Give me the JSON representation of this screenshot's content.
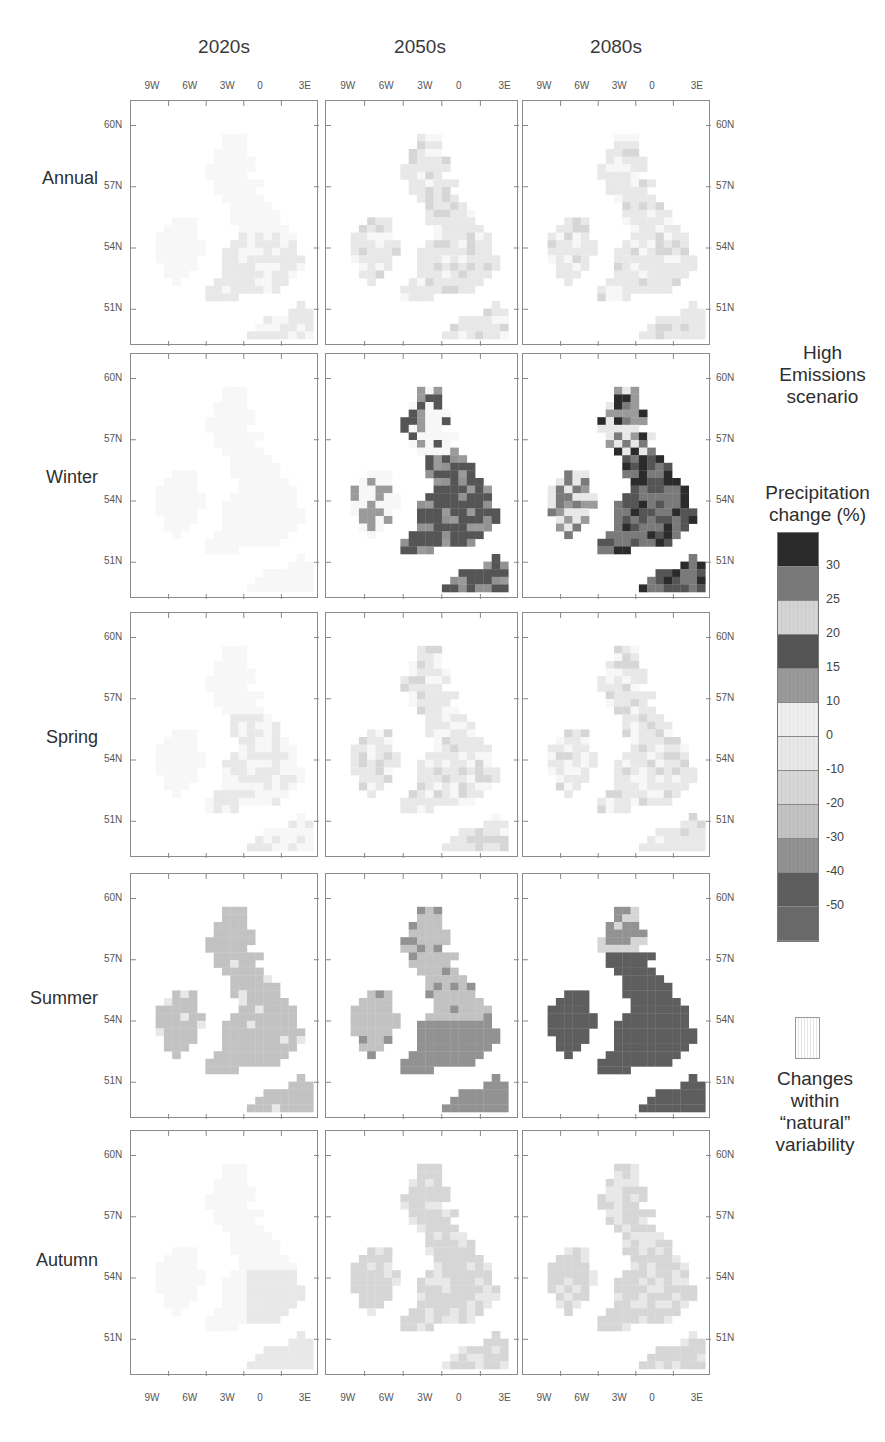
{
  "chart_data": {
    "type": "heatmap",
    "title": "High Emissions scenario",
    "subtitle": "Precipitation change (%)",
    "columns": [
      "2020s",
      "2050s",
      "2080s"
    ],
    "rows": [
      "Annual",
      "Winter",
      "Spring",
      "Summer",
      "Autumn"
    ],
    "x_ticks": [
      "9W",
      "6W",
      "3W",
      "0",
      "3E"
    ],
    "y_ticks": [
      "60N",
      "57N",
      "54N",
      "51N"
    ],
    "legend": {
      "title": "Precipitation change (%)",
      "tick_labels": [
        "30",
        "25",
        "20",
        "15",
        "10",
        "0",
        "-10",
        "-20",
        "-30",
        "-40",
        "-50"
      ],
      "bands": [
        {
          "range": ">30",
          "color": "#2b2b2b"
        },
        {
          "range": "25 to 30",
          "color": "#7a7a7a"
        },
        {
          "range": "20 to 25",
          "color": "#d4d4d4"
        },
        {
          "range": "15 to 20",
          "color": "#555555"
        },
        {
          "range": "10 to 15",
          "color": "#9a9a9a"
        },
        {
          "range": "0 to 10",
          "color": "#eeeeee"
        },
        {
          "range": "-10 to 0",
          "color": "#e8e8e8"
        },
        {
          "range": "-20 to -10",
          "color": "#d6d6d6"
        },
        {
          "range": "-30 to -20",
          "color": "#c2c2c2"
        },
        {
          "range": "-40 to -30",
          "color": "#929292"
        },
        {
          "range": "-50 to -40",
          "color": "#5e5e5e"
        },
        {
          "range": "<-50",
          "color": "#6a6a6a"
        }
      ],
      "natural_variability_label": "Changes within “natural” variability"
    },
    "panels": [
      {
        "row": "Annual",
        "col": "2020s",
        "dominant": "within natural variability / -10 to 0"
      },
      {
        "row": "Annual",
        "col": "2050s",
        "dominant": "-10 to 0 / -20 to -10"
      },
      {
        "row": "Annual",
        "col": "2080s",
        "dominant": "-10 to 0 / -20 to -10"
      },
      {
        "row": "Winter",
        "col": "2020s",
        "dominant": "within natural variability"
      },
      {
        "row": "Winter",
        "col": "2050s",
        "dominant": "10 to 20 (England), mixed north"
      },
      {
        "row": "Winter",
        "col": "2080s",
        "dominant": "15 to 30+ (England), mixed"
      },
      {
        "row": "Spring",
        "col": "2020s",
        "dominant": "within natural variability"
      },
      {
        "row": "Spring",
        "col": "2050s",
        "dominant": "-10 to 0"
      },
      {
        "row": "Spring",
        "col": "2080s",
        "dominant": "-10 to 0 / -20 to -10"
      },
      {
        "row": "Summer",
        "col": "2020s",
        "dominant": "-20 to -10"
      },
      {
        "row": "Summer",
        "col": "2050s",
        "dominant": "-30 to -20 / -40 to -30"
      },
      {
        "row": "Summer",
        "col": "2080s",
        "dominant": "-50 to -40 and below"
      },
      {
        "row": "Autumn",
        "col": "2020s",
        "dominant": "within natural variability / -10 to 0"
      },
      {
        "row": "Autumn",
        "col": "2050s",
        "dominant": "-10 to 0"
      },
      {
        "row": "Autumn",
        "col": "2080s",
        "dominant": "-10 to 0 / -20 to -10"
      }
    ]
  },
  "header": {
    "columns": [
      "2020s",
      "2050s",
      "2080s"
    ]
  },
  "axes": {
    "x_ticks": [
      "9W",
      "6W",
      "3W",
      "0",
      "3E"
    ],
    "y_ticks": [
      "60N",
      "57N",
      "54N",
      "51N"
    ]
  },
  "rows": [
    "Annual",
    "Winter",
    "Spring",
    "Summer",
    "Autumn"
  ],
  "legend": {
    "scenario_title": "High Emissions scenario",
    "scenario_lines": [
      "High",
      "Emissions",
      "scenario"
    ],
    "cb_title_lines": [
      "Precipitation",
      "change (%)"
    ],
    "cb_ticks": [
      "30",
      "25",
      "20",
      "15",
      "10",
      "0",
      "-10",
      "-20",
      "-30",
      "-40",
      "-50"
    ],
    "cb_colors": [
      "#2b2b2b",
      "#7a7a7a",
      "#d4d4d4",
      "#555555",
      "#9a9a9a",
      "#eeeeee",
      "#e8e8e8",
      "#d6d6d6",
      "#c2c2c2",
      "#929292",
      "#5e5e5e",
      "#6a6a6a"
    ],
    "natural_lines": [
      "Changes",
      "within",
      "“natural”",
      "variability"
    ]
  }
}
